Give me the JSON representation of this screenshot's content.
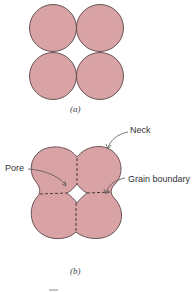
{
  "figure": {
    "part_a": {
      "caption": "(a)"
    },
    "part_b": {
      "caption": "(b)",
      "labels": {
        "neck": "Neck",
        "pore": "Pore",
        "grain_boundary": "Grain boundary"
      }
    }
  },
  "colors": {
    "particle_fill": "#d9a3a6",
    "outline": "#5a4446",
    "arrow": "#555555",
    "background": "#ffffff"
  }
}
